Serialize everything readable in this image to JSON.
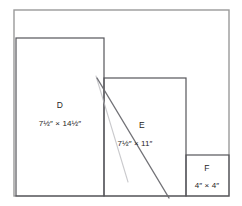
{
  "figure": {
    "background_color": "#ffffff",
    "outer_frame": {
      "name": "outer-frame",
      "color": "#9a9a9a",
      "x": 14,
      "y": 10,
      "width": 215,
      "height": 186
    },
    "rectangles": [
      {
        "id": "D",
        "letter": "D",
        "dimensions": "7½″ × 14½″",
        "color": "#55555a",
        "x": 16,
        "y": 38,
        "width": 88,
        "height": 158,
        "letter_x": 60,
        "letter_y": 108,
        "dims_x": 60,
        "dims_y": 126
      },
      {
        "id": "E",
        "letter": "E",
        "dimensions": "7½″ × 11″",
        "color": "#55555a",
        "x": 104,
        "y": 78,
        "width": 82,
        "height": 118,
        "letter_x": 142,
        "letter_y": 128,
        "dims_x": 135,
        "dims_y": 146
      },
      {
        "id": "F",
        "letter": "F",
        "dimensions": "4″ × 4″",
        "color": "#55555a",
        "x": 186,
        "y": 155,
        "width": 43,
        "height": 41,
        "letter_x": 207,
        "letter_y": 171,
        "dims_x": 207,
        "dims_y": 188
      }
    ],
    "diagonal_lines": [
      {
        "name": "primary-diagonal",
        "color": "#6b6b70",
        "opacity": 0.95,
        "width": 1.4,
        "x1": 97,
        "y1": 78,
        "x2": 169,
        "y2": 198
      },
      {
        "name": "ghost-diagonal",
        "color": "#b9b9bd",
        "opacity": 0.75,
        "width": 1.1,
        "x1": 96,
        "y1": 76,
        "x2": 128,
        "y2": 182
      }
    ]
  }
}
